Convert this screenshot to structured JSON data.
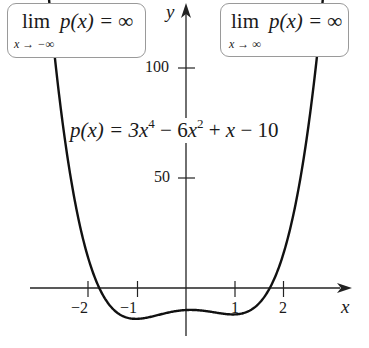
{
  "chart_data": {
    "type": "line",
    "title": "",
    "function": "p(x) = 3x^4 - 6x^2 + x - 10",
    "xlabel": "x",
    "ylabel": "y",
    "xlim": [
      -3.8,
      3.6
    ],
    "ylim": [
      -22,
      128
    ],
    "x_ticks": [
      -2,
      -1,
      1,
      2
    ],
    "y_ticks": [
      50,
      100
    ],
    "grid": false,
    "series": [
      {
        "name": "p(x)",
        "x": [
          -2.87,
          -2.5,
          -2,
          -1.5,
          -1.2,
          -1,
          -0.8,
          -0.5,
          0,
          0.5,
          0.8,
          1,
          1.2,
          1.5,
          2,
          2.5,
          2.81
        ],
        "values": [
          102.7,
          42.2,
          10.0,
          -7.3,
          -12.6,
          -14.0,
          -13.2,
          -12.3,
          -10.0,
          -11.3,
          -11.8,
          -12.0,
          -11.6,
          -8.3,
          16.0,
          45.2,
          99.2
        ]
      }
    ],
    "annotations": [
      "lim_{x → −∞} p(x) = ∞",
      "lim_{x → ∞} p(x) = ∞",
      "p(x) = 3x^4 − 6x^2 + x − 10"
    ]
  },
  "labels": {
    "left_limit": {
      "main_lim": "lim",
      "main_rest": "p(x) = ∞",
      "sub": "x → −∞"
    },
    "right_limit": {
      "main_lim": "lim",
      "main_rest": "p(x) = ∞",
      "sub": "x → ∞"
    },
    "equation": {
      "lhs": "p(x) = 3",
      "x1": "x",
      "e1": "4",
      "mid": " − 6",
      "x2": "x",
      "e2": "2",
      "plus": " + ",
      "x3": "x",
      "tail": " − 10"
    },
    "y_ticks": [
      "100",
      "50"
    ],
    "x_ticks": [
      "−2",
      "−1",
      "1",
      "2"
    ],
    "x_axis": "x",
    "y_axis": "y"
  },
  "colors": {
    "curve": "#111111",
    "axes": "#222222",
    "box_border": "#9a9a9a"
  }
}
